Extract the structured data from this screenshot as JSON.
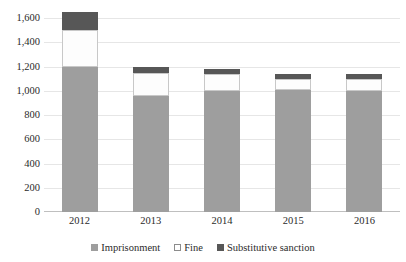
{
  "chart_data": {
    "type": "bar",
    "stacked": true,
    "title": "",
    "subtitle": "",
    "xlabel": "",
    "ylabel": "",
    "categories": [
      "2012",
      "2013",
      "2014",
      "2015",
      "2016"
    ],
    "ytick_labels": [
      "0",
      "200",
      "400",
      "600",
      "800",
      "1,000",
      "1,200",
      "1,400",
      "1,600"
    ],
    "ytick_values": [
      0,
      200,
      400,
      600,
      800,
      1000,
      1200,
      1400,
      1600
    ],
    "ylim": [
      0,
      1650
    ],
    "grid": true,
    "legend_position": "bottom",
    "series": [
      {
        "name": "Imprisonment",
        "color": "#9e9e9e",
        "values": [
          1200,
          960,
          1000,
          1010,
          1000
        ]
      },
      {
        "name": "Fine",
        "color": "#ffffff",
        "values": [
          305,
          190,
          140,
          90,
          95
        ]
      },
      {
        "name": "Substitutive sanction",
        "color": "#575757",
        "values": [
          145,
          50,
          40,
          40,
          40
        ]
      }
    ],
    "totals": [
      1650,
      1200,
      1180,
      1140,
      1135
    ]
  },
  "legend": {
    "items": [
      {
        "label": "Imprisonment",
        "swatch": "imprisonment"
      },
      {
        "label": "Fine",
        "swatch": "fine"
      },
      {
        "label": "Substitutive sanction",
        "swatch": "substitutive"
      }
    ]
  },
  "colors": {
    "imprisonment": "#9e9e9e",
    "fine": "#ffffff",
    "substitutive_sanction": "#575757",
    "gridline": "#e6e6e6",
    "axis": "#bfbfbf",
    "text": "#2b2b2b",
    "background": "#ffffff"
  }
}
